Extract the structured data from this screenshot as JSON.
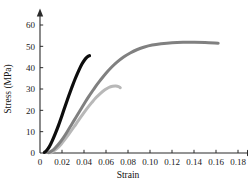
{
  "chart_data": {
    "type": "line",
    "title": "",
    "xlabel": "Strain",
    "ylabel": "Stress (MPa)",
    "xlim": [
      0,
      0.19
    ],
    "ylim": [
      0,
      64
    ],
    "grid": false,
    "legend": "none",
    "xticks": [
      "0",
      "0.02",
      "0.04",
      "0.06",
      "0.08",
      "0.10",
      "0.12",
      "0.14",
      "0.16",
      "0.18"
    ],
    "xtick_values": [
      0,
      0.02,
      0.04,
      0.06,
      0.08,
      0.1,
      0.12,
      0.14,
      0.16,
      0.18
    ],
    "yticks": [
      "0",
      "10",
      "20",
      "30",
      "40",
      "50",
      "60"
    ],
    "ytick_values": [
      0,
      10,
      20,
      30,
      40,
      50,
      60
    ],
    "series": [
      {
        "name": "black-curve",
        "color": "#0d0d0d",
        "linewidth": 3.2,
        "x": [
          0.004,
          0.006,
          0.0085,
          0.011,
          0.014,
          0.017,
          0.02,
          0.023,
          0.026,
          0.029,
          0.032,
          0.035,
          0.038,
          0.0405,
          0.0425,
          0.044,
          0.045
        ],
        "y": [
          0.3,
          1.2,
          3.0,
          5.6,
          9.2,
          13.2,
          17.6,
          22.2,
          26.6,
          30.8,
          34.8,
          38.4,
          41.6,
          43.6,
          44.8,
          45.4,
          45.6
        ]
      },
      {
        "name": "dark-gray-curve",
        "color": "#808080",
        "linewidth": 3.0,
        "x": [
          0.008,
          0.0105,
          0.0135,
          0.017,
          0.021,
          0.025,
          0.029,
          0.033,
          0.037,
          0.041,
          0.045,
          0.05,
          0.055,
          0.06,
          0.065,
          0.07,
          0.076,
          0.082,
          0.088,
          0.095,
          0.102,
          0.11,
          0.12,
          0.13,
          0.14,
          0.15,
          0.162
        ],
        "y": [
          0.2,
          0.9,
          2.2,
          4.2,
          7.0,
          10.2,
          13.6,
          17.0,
          20.4,
          23.8,
          27.0,
          30.8,
          34.2,
          37.4,
          40.2,
          42.6,
          45.0,
          46.9,
          48.4,
          49.7,
          50.6,
          51.2,
          51.7,
          51.9,
          51.9,
          51.8,
          51.5
        ]
      },
      {
        "name": "light-gray-curve",
        "color": "#b8b8b8",
        "linewidth": 3.0,
        "x": [
          0.01,
          0.0125,
          0.0155,
          0.019,
          0.023,
          0.027,
          0.031,
          0.035,
          0.039,
          0.043,
          0.047,
          0.051,
          0.055,
          0.059,
          0.0625,
          0.066,
          0.069,
          0.0715,
          0.073
        ],
        "y": [
          0.2,
          0.9,
          2.1,
          4.0,
          6.6,
          9.4,
          12.3,
          15.3,
          18.2,
          21.0,
          23.6,
          26.0,
          28.0,
          29.6,
          30.7,
          31.3,
          31.4,
          31.1,
          30.6
        ]
      }
    ]
  }
}
